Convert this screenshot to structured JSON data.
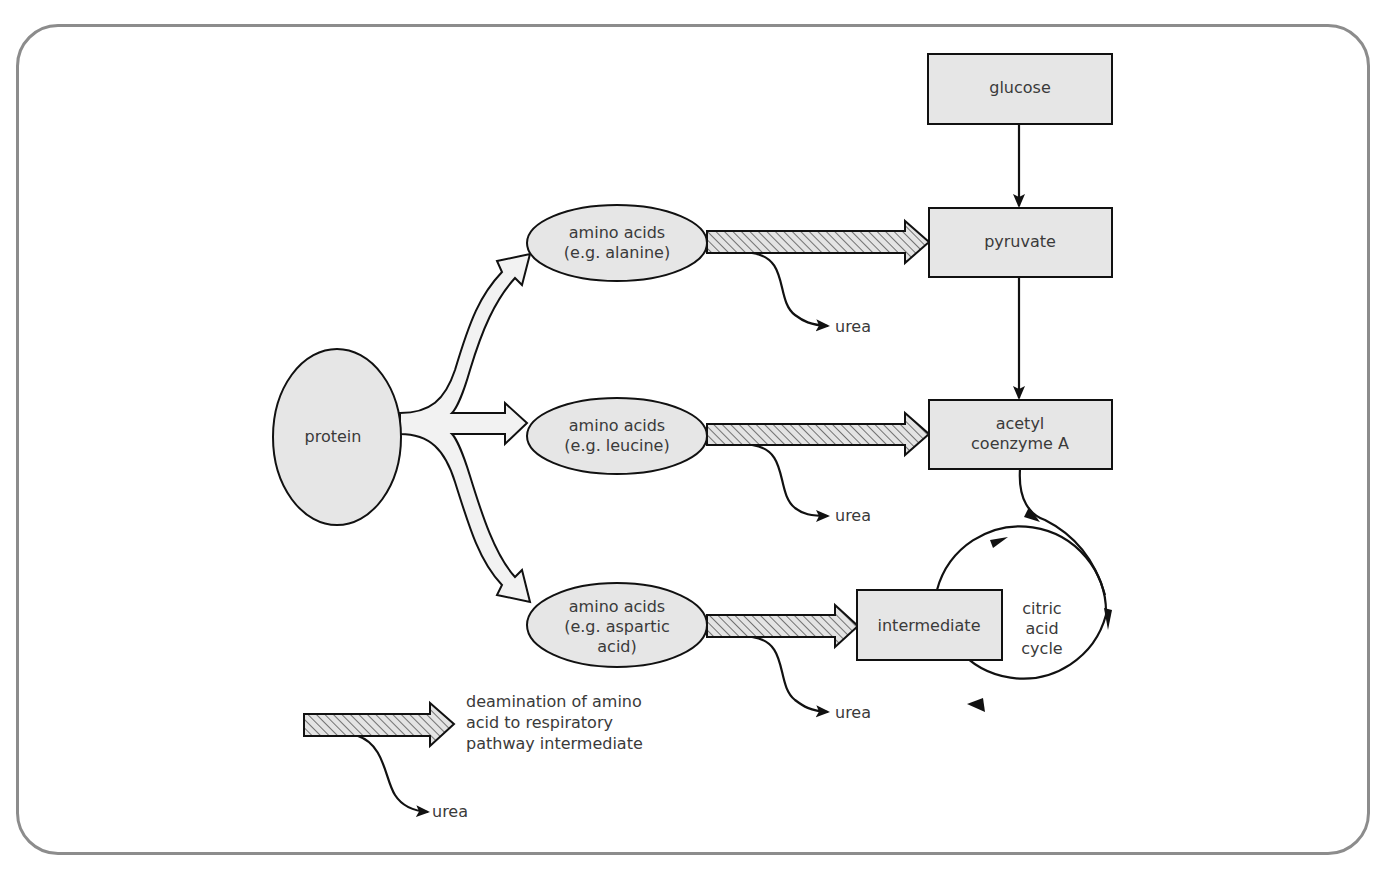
{
  "diagram": {
    "nodes": {
      "protein": "protein",
      "amino_alanine": "amino acids\n(e.g. alanine)",
      "amino_leucine": "amino acids\n(e.g. leucine)",
      "amino_aspartic": "amino acids\n(e.g. aspartic\nacid)",
      "glucose": "glucose",
      "pyruvate": "pyruvate",
      "acetyl_coa": "acetyl\ncoenzyme A",
      "intermediate": "intermediate",
      "citric_acid_cycle": "citric\nacid\ncycle"
    },
    "byproducts": {
      "urea_1": "urea",
      "urea_2": "urea",
      "urea_3": "urea"
    },
    "legend": {
      "description": "deamination of amino\nacid to respiratory\npathway intermediate",
      "urea": "urea"
    },
    "colors": {
      "box_fill": "#e6e6e6",
      "stroke": "#111111",
      "text": "#3a3a3a",
      "fork_fill": "#f2f2f2",
      "frame": "#8c8c8c"
    }
  }
}
